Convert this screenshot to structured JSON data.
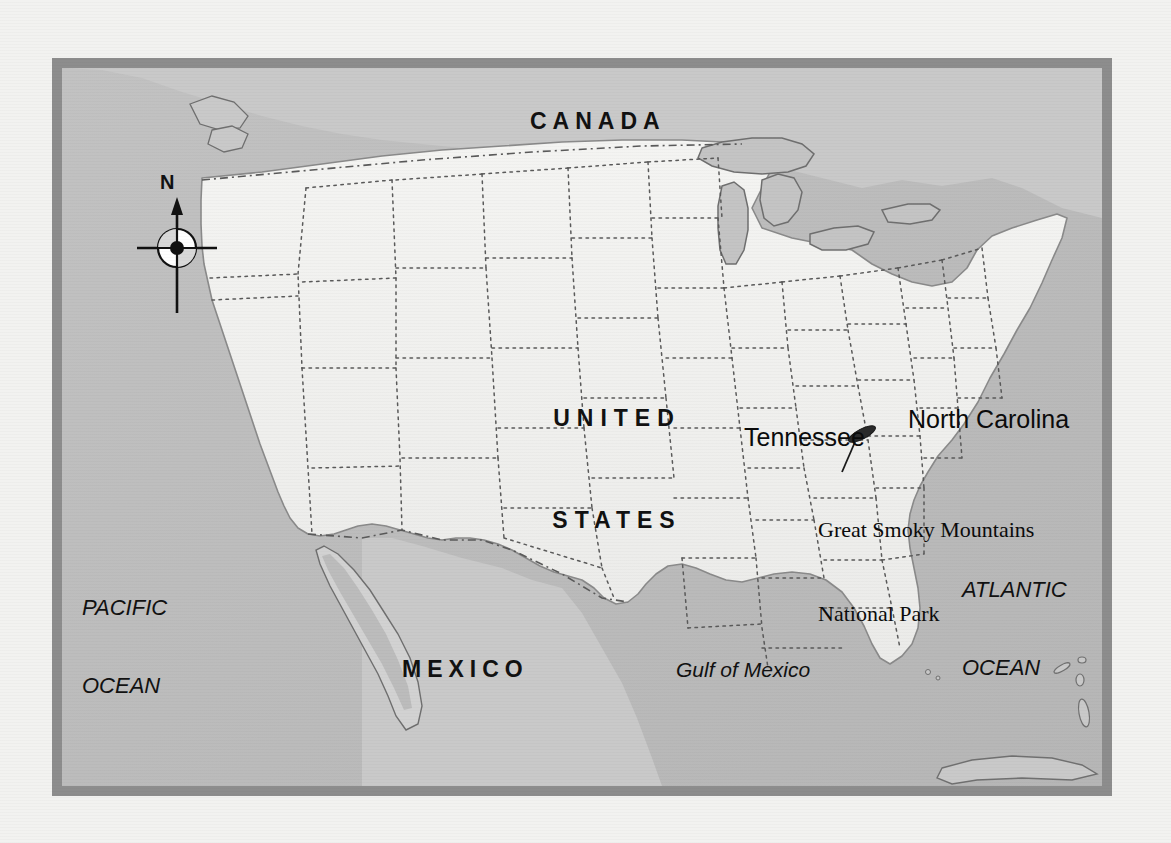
{
  "map": {
    "title": "Great Smoky Mountains National Park location map",
    "frame_color": "#8d8d8d",
    "water_color": "#bdbdbd",
    "us_land_color": "#f0f0ee",
    "foreign_land_color": "#c9c9c9",
    "labels": {
      "canada": "CANADA",
      "united_states_line1": "UNITED",
      "united_states_line2": "STATES",
      "mexico": "MEXICO",
      "pacific_ocean_line1": "PACIFIC",
      "pacific_ocean_line2": "OCEAN",
      "atlantic_ocean_line1": "ATLANTIC",
      "atlantic_ocean_line2": "OCEAN",
      "gulf_of_mexico": "Gulf of Mexico",
      "tennessee": "Tennessee",
      "north_carolina": "North Carolina",
      "park_line1": "Great Smoky Mountains",
      "park_line2": "National Park"
    },
    "compass": {
      "north_letter": "N"
    },
    "scale": {
      "miles_zero": "0",
      "miles_value": "500 miles",
      "km_zero": "0",
      "km_value": "800 kilometers",
      "tick_count": 10
    }
  }
}
